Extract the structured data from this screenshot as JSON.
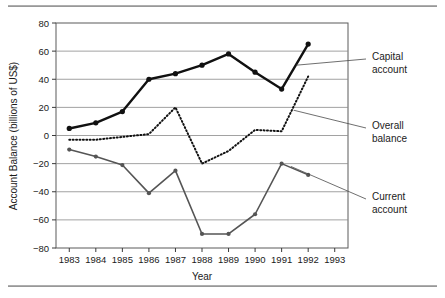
{
  "figure": {
    "background_color": "#ffffff",
    "rule_color": "#8d8d8d"
  },
  "chart_data": {
    "type": "line",
    "title": "",
    "xlabel": "Year",
    "ylabel": "Account  Balance (billions of US$)",
    "x": [
      1983,
      1984,
      1985,
      1986,
      1987,
      1988,
      1989,
      1990,
      1991,
      1992
    ],
    "xticklabels": [
      "1983",
      "1984",
      "1985",
      "1986",
      "1987",
      "1988",
      "1989",
      "1990",
      "1991",
      "1992",
      "1993"
    ],
    "xticks": [
      1983,
      1984,
      1985,
      1986,
      1987,
      1988,
      1989,
      1990,
      1991,
      1992,
      1993
    ],
    "xlim": [
      1982.5,
      1993.5
    ],
    "yticklabels": [
      "80",
      "60",
      "40",
      "20",
      "0",
      "−20",
      "−40",
      "−60",
      "−80"
    ],
    "yticks": [
      80,
      60,
      40,
      20,
      0,
      -20,
      -40,
      -60,
      -80
    ],
    "ylim": [
      -80,
      80
    ],
    "grid": "horizontal",
    "legend_position": "annotations-right",
    "series": [
      {
        "name": "Capital account",
        "label": "Capital\naccount",
        "label_line1": "Capital",
        "label_line2": "account",
        "style": "solid-thick",
        "color": "#111111",
        "marker": "circle",
        "values": [
          5,
          9,
          17,
          40,
          44,
          50,
          58,
          45,
          33,
          65
        ]
      },
      {
        "name": "Overall balance",
        "label": "Overall\nbalance",
        "label_line1": "Overall",
        "label_line2": "balance",
        "style": "dotted",
        "color": "#111111",
        "marker": "none",
        "values": [
          -3,
          -3,
          -1,
          1,
          20,
          -20,
          -11,
          4,
          3,
          42
        ]
      },
      {
        "name": "Current account",
        "label": "Current\naccount",
        "label_line1": "Current",
        "label_line2": "account",
        "style": "solid-medium",
        "color": "#555555",
        "marker": "circle",
        "values": [
          -10,
          -15,
          -21,
          -41,
          -25,
          -70,
          -70,
          -56,
          -20,
          -28
        ]
      }
    ],
    "annotations": [
      {
        "text_line1": "Capital",
        "text_line2": "account",
        "target_year": 1991.55,
        "target_value": 50
      },
      {
        "text_line1": "Overall",
        "text_line2": "balance",
        "target_year": 1991.45,
        "target_value": 18
      },
      {
        "text_line1": "Current",
        "text_line2": "account",
        "target_year": 1991.35,
        "target_value": -22
      }
    ]
  }
}
